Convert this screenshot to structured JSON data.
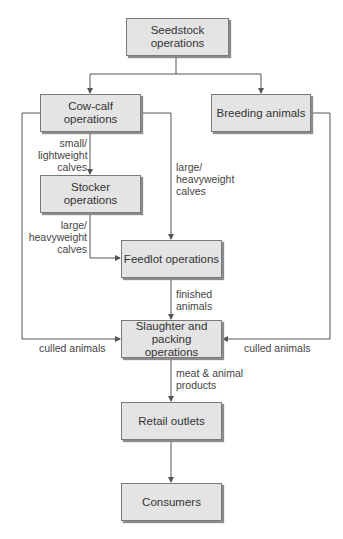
{
  "nodes": {
    "seedstock": "Seedstock operations",
    "cowcalf": "Cow-calf operations",
    "breeding": "Breeding animals",
    "stocker": "Stocker operations",
    "feedlot": "Feedlot operations",
    "slaughter": "Slaughter and packing operations",
    "retail": "Retail outlets",
    "consumers": "Consumers"
  },
  "edges": {
    "small_calves": [
      "small/",
      "lightweight",
      "calves"
    ],
    "large_calves_stocker": [
      "large/",
      "heavyweight",
      "calves"
    ],
    "large_calves_cowcalf": [
      "large/",
      "heavyweight",
      "calves"
    ],
    "finished": [
      "finished",
      "animals"
    ],
    "culled_left": "culled animals",
    "culled_right": "culled animals",
    "meat": [
      "meat & animal",
      "products"
    ]
  },
  "colors": {
    "box_fill": "#e4e4e4",
    "box_border": "#7a7a7a",
    "line": "#555555",
    "text": "#333333"
  }
}
